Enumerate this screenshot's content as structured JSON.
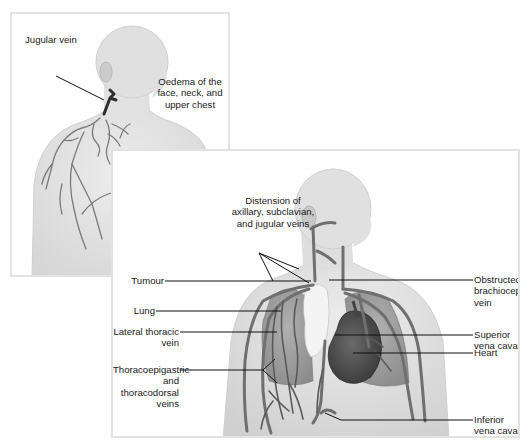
{
  "colors": {
    "background": "#ffffff",
    "panel_border": "#e2e2e2",
    "body_fill": "#e6e6e6",
    "body_edge": "#cfcfcf",
    "vein": "#6f6f6f",
    "vein_dark": "#3c3c3c",
    "lung": "#9a9a9a",
    "heart": "#505050",
    "tumour": "#f4f4f4",
    "leader_line": "#111111",
    "label_text": "#1a1a1a"
  },
  "panel_a": {
    "labels": {
      "jugular_vein": "Jugular vein",
      "oedema": "Oedema of the\nface, neck, and\nupper chest"
    }
  },
  "panel_b": {
    "labels": {
      "distension": "Distension of\naxillary, subclavian,\nand jugular veins",
      "tumour": "Tumour",
      "lung": "Lung",
      "lateral_thoracic": "Lateral thoracic\nvein",
      "thoracoepigastric": "Thoracoepigastric\nand thoracodorsal\nveins",
      "obstructed": "Obstructed\nbrachiocephalic\nvein",
      "svc": "Superior\nvena cava",
      "heart": "Heart",
      "ivc": "Inferior\nvena cava"
    }
  }
}
